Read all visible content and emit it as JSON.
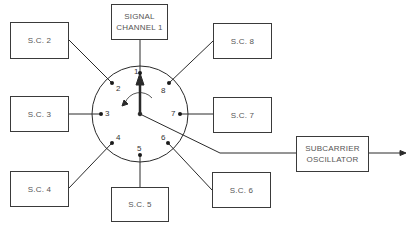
{
  "diagram": {
    "switch": {
      "center": [
        140,
        114
      ],
      "radius": 48,
      "contacts": [
        {
          "id": "1",
          "label": "1"
        },
        {
          "id": "2",
          "label": "2"
        },
        {
          "id": "3",
          "label": "3"
        },
        {
          "id": "4",
          "label": "4"
        },
        {
          "id": "5",
          "label": "5"
        },
        {
          "id": "6",
          "label": "6"
        },
        {
          "id": "7",
          "label": "7"
        },
        {
          "id": "8",
          "label": "8"
        }
      ],
      "rotation": "counter-clockwise"
    },
    "boxes": {
      "signal_channel_1": {
        "line1": "SIGNAL",
        "line2": "CHANNEL 1"
      },
      "sc2": "S.C. 2",
      "sc3": "S.C. 3",
      "sc4": "S.C. 4",
      "sc5": "S.C. 5",
      "sc6": "S.C. 6",
      "sc7": "S.C. 7",
      "sc8": "S.C. 8",
      "oscillator": {
        "line1": "SUBCARRIER",
        "line2": "OSCILLATOR"
      }
    },
    "colors": {
      "line": "#2a2a2a",
      "text": "#555555"
    }
  }
}
